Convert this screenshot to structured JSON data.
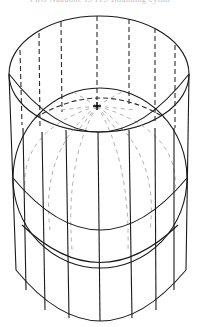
{
  "caption": "PRO Nuabone IS ITS Bounding cylinder",
  "figure": {
    "type": "wireframe-illustration",
    "colors": {
      "line": "#1a1a1a",
      "hidden_line": "#2a2a2a",
      "faint_line": "#9a9a9a",
      "background": "#ffffff"
    },
    "center_mark": "+"
  }
}
